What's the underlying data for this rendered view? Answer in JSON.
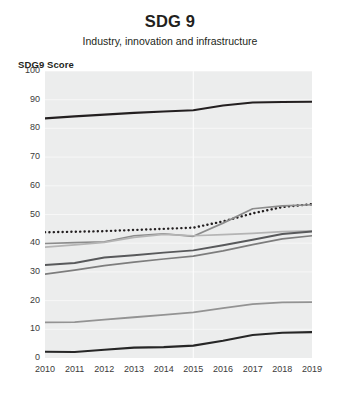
{
  "chart_data": {
    "type": "line",
    "title": "SDG 9",
    "subtitle": "Industry, innovation and infrastructure",
    "ylabel": "SDG9 Score",
    "xlabel": "",
    "x": [
      2010,
      2011,
      2012,
      2013,
      2014,
      2015,
      2016,
      2017,
      2018,
      2019
    ],
    "categories": [
      "2010",
      "2011",
      "2012",
      "2013",
      "2014",
      "2015",
      "2016",
      "2017",
      "2018",
      "2019"
    ],
    "ylim": [
      0,
      100
    ],
    "xlim": [
      2010,
      2019
    ],
    "yticks": [
      0,
      10,
      20,
      30,
      40,
      50,
      60,
      70,
      80,
      90,
      100
    ],
    "xticks": [
      "2010",
      "2011",
      "2012",
      "2013",
      "2014",
      "2015",
      "2016",
      "2017",
      "2018",
      "2019"
    ],
    "grid": true,
    "grid_color": "#f7f7f7",
    "plot_background": "#eceded",
    "legend": "none",
    "series": [
      {
        "name": "series-top-black",
        "style": "solid",
        "color": "#231f20",
        "width": 2.1,
        "values": [
          83.5,
          84.2,
          84.8,
          85.4,
          85.9,
          86.3,
          88.0,
          89.0,
          89.2,
          89.3
        ]
      },
      {
        "name": "series-dotted",
        "style": "dotted",
        "color": "#231f20",
        "width": 2.4,
        "values": [
          43.8,
          44.0,
          44.2,
          44.6,
          45.0,
          45.4,
          47.6,
          50.4,
          52.6,
          53.6
        ]
      },
      {
        "name": "series-rising-gray",
        "style": "solid",
        "color": "#8c8c8c",
        "width": 1.7,
        "values": [
          39.9,
          40.2,
          40.5,
          42.6,
          43.3,
          42.4,
          47.0,
          52.0,
          53.0,
          53.4
        ]
      },
      {
        "name": "series-flat-light-gray",
        "style": "solid",
        "color": "#b4b4b4",
        "width": 1.7,
        "values": [
          38.6,
          39.4,
          40.3,
          42.0,
          43.1,
          42.6,
          43.0,
          43.4,
          44.0,
          44.3
        ]
      },
      {
        "name": "series-mid-dark-gray",
        "style": "solid",
        "color": "#58595b",
        "width": 1.9,
        "values": [
          32.4,
          33.1,
          35.0,
          35.8,
          36.7,
          37.5,
          39.3,
          41.2,
          43.2,
          44.1
        ]
      },
      {
        "name": "series-lower-gray",
        "style": "solid",
        "color": "#7d7d7d",
        "width": 1.7,
        "values": [
          29.2,
          30.6,
          32.2,
          33.4,
          34.5,
          35.5,
          37.3,
          39.5,
          41.5,
          42.6
        ]
      },
      {
        "name": "series-low-gray",
        "style": "solid",
        "color": "#939393",
        "width": 1.8,
        "values": [
          12.4,
          12.5,
          13.4,
          14.2,
          15.0,
          15.9,
          17.4,
          18.8,
          19.4,
          19.5
        ]
      },
      {
        "name": "series-bottom-black",
        "style": "solid",
        "color": "#262626",
        "width": 2.1,
        "values": [
          2.2,
          2.1,
          2.9,
          3.6,
          3.8,
          4.3,
          6.0,
          8.0,
          8.8,
          9.0
        ]
      }
    ]
  }
}
